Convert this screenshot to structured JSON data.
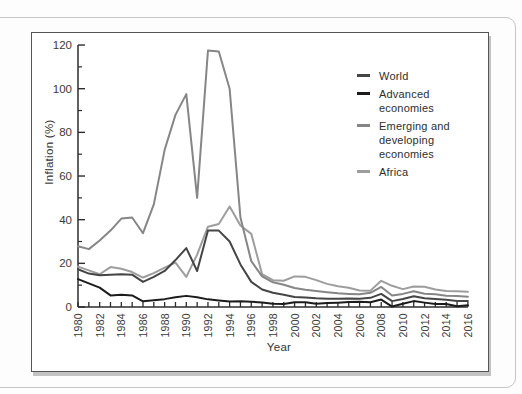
{
  "chart_data": {
    "type": "line",
    "title": "",
    "xlabel": "Year",
    "ylabel": "Inflation (%)",
    "x_range": [
      1980,
      2016
    ],
    "ylim": [
      0,
      120
    ],
    "y_ticks": [
      0,
      20,
      40,
      60,
      80,
      100,
      120
    ],
    "y_minor_ticks": [
      10,
      30,
      50,
      70,
      90,
      110
    ],
    "x_tick_every": 1,
    "x_label_every": 2,
    "grid": false,
    "legend_position": "upper right",
    "axis_color": "#2d2d2d",
    "tick_label_color": "#3a3a3a",
    "years": [
      1980,
      1981,
      1982,
      1983,
      1984,
      1985,
      1986,
      1987,
      1988,
      1989,
      1990,
      1991,
      1992,
      1993,
      1994,
      1995,
      1996,
      1997,
      1998,
      1999,
      2000,
      2001,
      2002,
      2003,
      2004,
      2005,
      2006,
      2007,
      2008,
      2009,
      2010,
      2011,
      2012,
      2013,
      2014,
      2015,
      2016
    ],
    "series": [
      {
        "name": "World",
        "color": "#454545",
        "values": [
          17.3,
          15.3,
          14.5,
          14.8,
          15.0,
          14.8,
          11.5,
          13.8,
          16.5,
          21.5,
          27.0,
          16.5,
          35.0,
          35.0,
          30.0,
          19.5,
          11.5,
          8.0,
          6.5,
          5.6,
          4.6,
          4.4,
          4.0,
          3.8,
          3.8,
          3.9,
          3.8,
          4.2,
          6.0,
          2.7,
          3.7,
          4.9,
          4.0,
          3.7,
          3.3,
          2.8,
          2.8
        ]
      },
      {
        "name": "Advanced economies",
        "color": "#1c1c1c",
        "values": [
          12.8,
          10.8,
          8.9,
          5.3,
          5.6,
          5.3,
          2.6,
          3.1,
          3.6,
          4.5,
          5.1,
          4.5,
          3.5,
          3.0,
          2.5,
          2.6,
          2.4,
          2.1,
          1.5,
          1.4,
          2.2,
          2.2,
          1.5,
          1.8,
          2.0,
          2.3,
          2.4,
          2.2,
          3.4,
          0.2,
          1.5,
          2.7,
          2.0,
          1.4,
          1.4,
          0.3,
          0.8
        ]
      },
      {
        "name": "Emerging and developing economies",
        "color": "#868686",
        "values": [
          27.8,
          26.5,
          30.5,
          35.0,
          40.5,
          41.0,
          33.8,
          47.0,
          72.0,
          88.0,
          97.5,
          50.0,
          117.5,
          117.0,
          100.0,
          41.0,
          21.0,
          14.0,
          11.3,
          10.2,
          8.7,
          7.9,
          7.3,
          6.8,
          6.3,
          6.0,
          5.8,
          6.5,
          9.2,
          5.3,
          6.0,
          7.2,
          6.1,
          5.8,
          5.2,
          5.0,
          4.7
        ]
      },
      {
        "name": "Africa",
        "color": "#9d9d9d",
        "values": [
          18.5,
          16.8,
          15.0,
          18.3,
          17.5,
          16.0,
          13.5,
          15.5,
          18.0,
          20.3,
          13.8,
          24.0,
          36.8,
          38.0,
          46.0,
          37.3,
          33.5,
          15.0,
          12.3,
          12.0,
          14.0,
          13.8,
          12.3,
          10.6,
          9.5,
          8.8,
          7.6,
          7.5,
          12.0,
          9.7,
          8.2,
          9.4,
          9.3,
          8.0,
          7.3,
          7.2,
          7.0
        ]
      }
    ],
    "layout": {
      "x0": 46,
      "y0": 274,
      "px_per_year": 10.83,
      "px_per_unit": 2.183,
      "major_tick_len": 7,
      "minor_tick_len": 4,
      "x_tick_len": 5,
      "line_width": 2
    }
  }
}
